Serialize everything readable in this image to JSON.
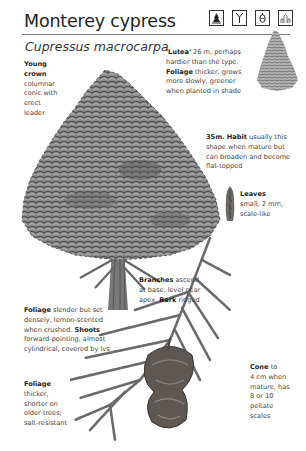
{
  "header": {
    "common_name": "Monterey cypress",
    "latin_name": "Cupressus macrocarpa",
    "icons": [
      {
        "name": "evergreen-conifer-icon"
      },
      {
        "name": "branch-habit-icon"
      },
      {
        "name": "cone-icon"
      },
      {
        "name": "coastal-tolerance-icon"
      }
    ]
  },
  "notes": {
    "young_crown": {
      "bold": "Young crown",
      "lines": [
        "columnar",
        "conic with",
        "erect",
        "leader"
      ]
    },
    "lutea": {
      "bold1": "'Lutea'",
      "text1": " 26 m, perhaps",
      "line2": "hardier than the type.",
      "bold2": "Foliage",
      "text2": " thicker, grows",
      "line4": "more slowly, greener",
      "line5": "when planted in shade"
    },
    "habit": {
      "bold": "35m. Habit",
      "text1": " usually this",
      "line2": "shape when mature but",
      "line3": "can broaden and become",
      "line4": "flat-topped"
    },
    "leaves": {
      "bold": "Leaves",
      "line2": "small, 2 mm,",
      "line3": "scale-like"
    },
    "branches": {
      "bold1": "Branches",
      "text1": " ascend",
      "line2": "at base, level near",
      "text3": "apex. ",
      "bold3": "Bark",
      "text3b": " ridged"
    },
    "foliage_young": {
      "bold1": "Foliage",
      "text1": " slender but set",
      "line2": "densely, lemon-scented",
      "text3": "when crushed. ",
      "bold3": "Shoots",
      "line4": "forward-pointing, almost",
      "line5": "cylindrical, covered by lvs"
    },
    "foliage_old": {
      "bold": "Foliage",
      "lines": [
        "thicker,",
        "shorter on",
        "older trees;",
        "salt-resistant"
      ]
    },
    "cone": {
      "bold": "Cone",
      "text1": " to",
      "lines": [
        "4 cm when",
        "mature, has",
        "8 or 10",
        "peltate",
        "scales"
      ]
    }
  },
  "colors": {
    "foliage_dark": "#4a4a4a",
    "foliage_mid": "#7d7d7d",
    "foliage_light": "#bdbdbd",
    "trunk": "#6a6a6a",
    "cone": "#5a5450",
    "rule": "#7a7a7a"
  }
}
